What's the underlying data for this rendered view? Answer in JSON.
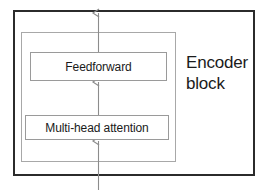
{
  "diagram": {
    "title": "Encoder block",
    "caption": {
      "line1": "Encoder",
      "line2": "block"
    },
    "outer_block": {
      "name": "encoder-block",
      "border_color": "#2b2b2b"
    },
    "inner_container": {
      "name": "encoder-inner-container",
      "border_color": "#a8a8a8"
    },
    "sublayers": [
      {
        "id": "feedforward",
        "label": "Feedforward",
        "border_color": "#9a9a9a"
      },
      {
        "id": "multi-head-attention",
        "label": "Multi-head attention",
        "border_color": "#9a9a9a"
      }
    ],
    "arrows": [
      {
        "id": "input-arrow",
        "from": "below-encoder-block",
        "to": "multi-head-attention",
        "direction": "up",
        "color": "#8c8c8c"
      },
      {
        "id": "attention-to-feedforward-arrow",
        "from": "multi-head-attention",
        "to": "feedforward",
        "direction": "up",
        "color": "#8c8c8c"
      },
      {
        "id": "output-arrow",
        "from": "feedforward",
        "to": "above-encoder-block",
        "direction": "up",
        "color": "#8c8c8c"
      }
    ],
    "colors": {
      "background": "#ffffff",
      "outer_border": "#2b2b2b",
      "inner_border": "#a8a8a8",
      "box_border": "#9a9a9a",
      "arrow": "#8c8c8c",
      "text": "#1a1a1a"
    }
  }
}
